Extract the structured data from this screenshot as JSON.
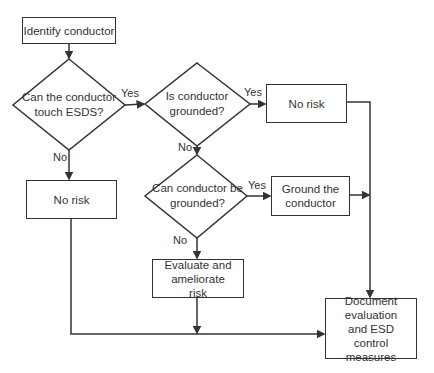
{
  "diagram": {
    "type": "flowchart",
    "nodes": {
      "identify": "Identify conductor",
      "q_touch": "Can the conductor touch ESDS?",
      "q_grounded": "Is conductor grounded?",
      "no_risk_top": "No risk",
      "no_risk_left": "No risk",
      "q_can_ground": "Can conductor be grounded?",
      "ground": "Ground the conductor",
      "evaluate": "Evaluate and ameliorate risk",
      "document": "Document evaluation and ESD control measures"
    },
    "edges": {
      "touch_yes": "Yes",
      "touch_no": "No",
      "grounded_yes": "Yes",
      "grounded_no": "No",
      "can_ground_yes": "Yes",
      "can_ground_no": "No"
    }
  }
}
